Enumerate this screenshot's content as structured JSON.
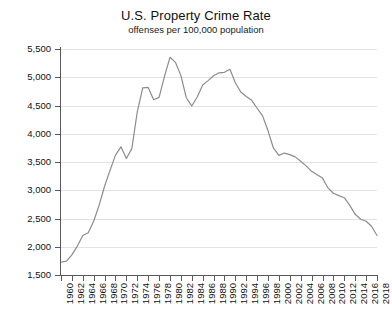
{
  "chart_data": {
    "type": "line",
    "title": "U.S. Property Crime Rate",
    "subtitle": "offenses per 100,000 population",
    "xlabel": "",
    "ylabel": "",
    "xlim": [
      1960,
      2018
    ],
    "ylim": [
      1500,
      5500
    ],
    "grid": true,
    "legend": "none",
    "line_color": "#8c8c8c",
    "axis_color": "#595959",
    "grid_color": "#e2e2e2",
    "ytick_labels": [
      "5,500",
      "5,000",
      "4,500",
      "4,000",
      "3,500",
      "3,000",
      "2,500",
      "2,000",
      "1,500"
    ],
    "ytick_values": [
      5500,
      5000,
      4500,
      4000,
      3500,
      3000,
      2500,
      2000,
      1500
    ],
    "xtick_labels": [
      "1960",
      "1962",
      "1964",
      "1966",
      "1968",
      "1970",
      "1972",
      "1974",
      "1976",
      "1978",
      "1980",
      "1982",
      "1984",
      "1986",
      "1988",
      "1990",
      "1992",
      "1994",
      "1996",
      "1998",
      "2000",
      "2002",
      "2004",
      "2006",
      "2008",
      "2010",
      "2012",
      "2014",
      "2016",
      "2018"
    ],
    "xtick_values": [
      1960,
      1962,
      1964,
      1966,
      1968,
      1970,
      1972,
      1974,
      1976,
      1978,
      1980,
      1982,
      1984,
      1986,
      1988,
      1990,
      1992,
      1994,
      1996,
      1998,
      2000,
      2002,
      2004,
      2006,
      2008,
      2010,
      2012,
      2014,
      2016,
      2018
    ],
    "x": [
      1960,
      1961,
      1962,
      1963,
      1964,
      1965,
      1966,
      1967,
      1968,
      1969,
      1970,
      1971,
      1972,
      1973,
      1974,
      1975,
      1976,
      1977,
      1978,
      1979,
      1980,
      1981,
      1982,
      1983,
      1984,
      1985,
      1986,
      1987,
      1988,
      1989,
      1990,
      1991,
      1992,
      1993,
      1994,
      1995,
      1996,
      1997,
      1998,
      1999,
      2000,
      2001,
      2002,
      2003,
      2004,
      2005,
      2006,
      2007,
      2008,
      2009,
      2010,
      2011,
      2012,
      2013,
      2014,
      2015,
      2016,
      2017,
      2018
    ],
    "values": [
      1726,
      1747,
      1857,
      2012,
      2198,
      2249,
      2451,
      2737,
      3071,
      3351,
      3621,
      3769,
      3561,
      3737,
      4389,
      4811,
      4820,
      4602,
      4643,
      5017,
      5353,
      5264,
      5033,
      4637,
      4492,
      4651,
      4863,
      4940,
      5027,
      5078,
      5088,
      5140,
      4903,
      4740,
      4660,
      4591,
      4451,
      4316,
      4052,
      3744,
      3618,
      3658,
      3631,
      3591,
      3514,
      3432,
      3335,
      3276,
      3215,
      3041,
      2946,
      2905,
      2868,
      2733,
      2574,
      2487,
      2451,
      2362,
      2200
    ],
    "series_name": "Property crime rate"
  }
}
